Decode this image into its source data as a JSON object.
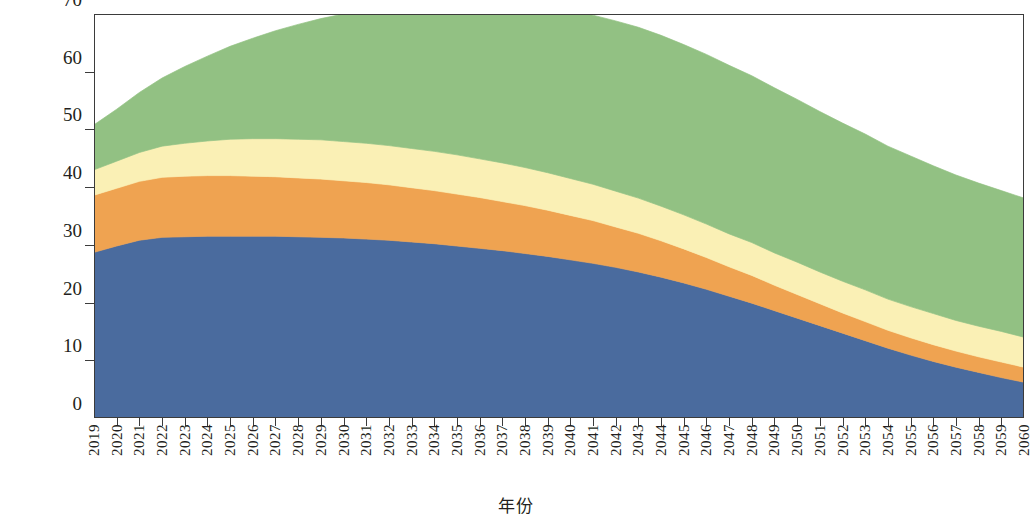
{
  "chart_data": {
    "type": "area",
    "stacked": true,
    "title": "",
    "xlabel": "年份",
    "ylabel": "供给总量/亿吨标准煤",
    "ylim": [
      0,
      70
    ],
    "yticks": [
      0,
      10,
      20,
      30,
      40,
      50,
      60,
      70
    ],
    "grid": false,
    "legend": "none",
    "x": [
      2019,
      2020,
      2021,
      2022,
      2023,
      2024,
      2025,
      2026,
      2027,
      2028,
      2029,
      2030,
      2031,
      2032,
      2033,
      2034,
      2035,
      2036,
      2037,
      2038,
      2039,
      2040,
      2041,
      2042,
      2043,
      2044,
      2045,
      2046,
      2047,
      2048,
      2049,
      2050,
      2051,
      2052,
      2053,
      2054,
      2055,
      2056,
      2057,
      2058,
      2059,
      2060
    ],
    "series": [
      {
        "name": "series-1",
        "color": "#4a6b9e",
        "values": [
          28.7,
          29.8,
          30.8,
          31.3,
          31.4,
          31.5,
          31.5,
          31.5,
          31.5,
          31.4,
          31.3,
          31.2,
          31.0,
          30.8,
          30.5,
          30.2,
          29.8,
          29.4,
          29.0,
          28.5,
          28.0,
          27.4,
          26.8,
          26.1,
          25.3,
          24.4,
          23.4,
          22.3,
          21.1,
          19.9,
          18.6,
          17.3,
          16.0,
          14.7,
          13.4,
          12.1,
          10.9,
          9.8,
          8.8,
          7.9,
          7.0,
          6.2
        ]
      },
      {
        "name": "series-2",
        "color": "#efa351",
        "values": [
          9.9,
          10.0,
          10.2,
          10.4,
          10.5,
          10.5,
          10.5,
          10.4,
          10.3,
          10.2,
          10.1,
          9.9,
          9.8,
          9.6,
          9.4,
          9.2,
          9.0,
          8.8,
          8.5,
          8.3,
          8.0,
          7.7,
          7.4,
          7.0,
          6.7,
          6.3,
          5.9,
          5.5,
          5.1,
          4.8,
          4.4,
          4.1,
          3.8,
          3.5,
          3.3,
          3.1,
          3.0,
          2.9,
          2.8,
          2.7,
          2.7,
          2.6
        ]
      },
      {
        "name": "series-3",
        "color": "#faf0b5",
        "values": [
          4.4,
          4.7,
          5.0,
          5.4,
          5.7,
          6.0,
          6.3,
          6.5,
          6.6,
          6.7,
          6.8,
          6.8,
          6.8,
          6.8,
          6.8,
          6.8,
          6.8,
          6.7,
          6.7,
          6.6,
          6.5,
          6.4,
          6.3,
          6.2,
          6.1,
          6.0,
          5.9,
          5.8,
          5.7,
          5.7,
          5.6,
          5.6,
          5.5,
          5.5,
          5.5,
          5.4,
          5.4,
          5.4,
          5.3,
          5.3,
          5.3,
          5.2
        ]
      },
      {
        "name": "series-4",
        "color": "#92c183",
        "values": [
          7.8,
          9.0,
          10.4,
          11.8,
          13.3,
          14.7,
          16.1,
          17.4,
          18.7,
          19.9,
          21.0,
          22.1,
          23.1,
          24.0,
          24.9,
          25.7,
          26.4,
          27.1,
          27.7,
          28.2,
          28.6,
          29.0,
          29.3,
          29.5,
          29.6,
          29.6,
          29.5,
          29.4,
          29.2,
          28.9,
          28.6,
          28.2,
          27.8,
          27.4,
          27.0,
          26.5,
          26.1,
          25.6,
          25.2,
          24.8,
          24.4,
          24.1
        ]
      }
    ],
    "totals": [
      50.8,
      53.5,
      56.4,
      58.9,
      60.9,
      62.7,
      64.4,
      65.8,
      67.1,
      68.2,
      69.2,
      70.0,
      70.7,
      71.2,
      71.6,
      71.9,
      72.0,
      72.0,
      71.9,
      71.6,
      71.1,
      70.5,
      69.8,
      68.8,
      67.7,
      66.3,
      64.7,
      63.0,
      61.1,
      59.3,
      57.2,
      55.2,
      53.1,
      51.1,
      49.2,
      47.1,
      45.4,
      43.7,
      42.1,
      40.7,
      39.4,
      38.1
    ]
  }
}
